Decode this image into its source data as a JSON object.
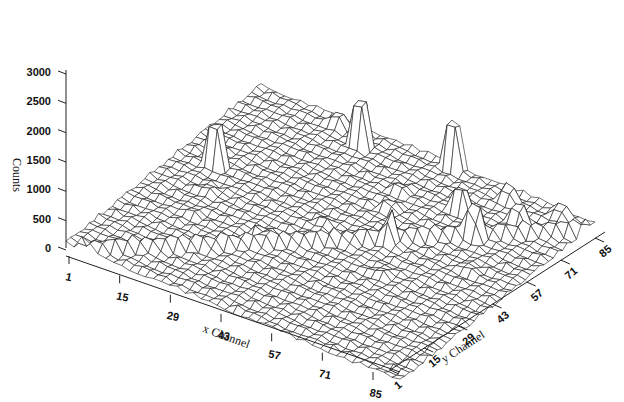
{
  "chart_data": {
    "type": "surface3d",
    "title": "",
    "zlabel": "Counts",
    "xlabel": "x Channel",
    "ylabel": "y Channel",
    "zlim": [
      0,
      3000
    ],
    "z_ticks": [
      "0",
      "500",
      "1000",
      "1500",
      "2000",
      "2500",
      "3000"
    ],
    "x_ticks": [
      "1",
      "15",
      "29",
      "43",
      "57",
      "71",
      "85"
    ],
    "y_ticks": [
      "1",
      "15",
      "29",
      "43",
      "57",
      "71",
      "85"
    ],
    "grid_size": [
      85,
      85
    ],
    "baseline_counts": 100,
    "ridge": {
      "description": "diagonal low ridge across surface",
      "height": 250
    },
    "peaks": [
      {
        "x": 10,
        "y": 50,
        "counts": 2750
      },
      {
        "x": 30,
        "y": 78,
        "counts": 2950
      },
      {
        "x": 22,
        "y": 82,
        "counts": 700
      },
      {
        "x": 50,
        "y": 84,
        "counts": 3000
      },
      {
        "x": 60,
        "y": 70,
        "counts": 1450
      },
      {
        "x": 68,
        "y": 62,
        "counts": 1350
      },
      {
        "x": 55,
        "y": 48,
        "counts": 800
      },
      {
        "x": 72,
        "y": 74,
        "counts": 1000
      },
      {
        "x": 66,
        "y": 80,
        "counts": 850
      },
      {
        "x": 78,
        "y": 82,
        "counts": 650
      },
      {
        "x": 32,
        "y": 32,
        "counts": 500
      },
      {
        "x": 48,
        "y": 60,
        "counts": 450
      },
      {
        "x": 46,
        "y": 68,
        "counts": 350
      },
      {
        "x": 14,
        "y": 40,
        "counts": 300
      },
      {
        "x": 16,
        "y": 30,
        "counts": 200
      },
      {
        "x": 40,
        "y": 45,
        "counts": 250
      },
      {
        "x": 60,
        "y": 36,
        "counts": 300
      },
      {
        "x": 74,
        "y": 50,
        "counts": 250
      }
    ]
  },
  "labels": {
    "z_title": "Counts",
    "x_title": "x Channel",
    "y_title": "y Channel"
  }
}
